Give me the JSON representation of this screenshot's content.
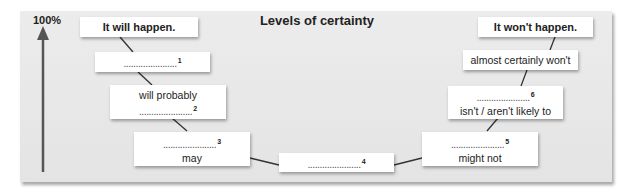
{
  "title": "Levels of certainty",
  "axis": {
    "top_label": "100%"
  },
  "blank": "......................",
  "left_column": [
    {
      "id": "will-happen",
      "lines": [
        "It will happen."
      ],
      "bold": true
    },
    {
      "id": "blank-1",
      "lines": [
        "BLANK"
      ],
      "number": "1"
    },
    {
      "id": "will-probably",
      "lines": [
        "will probably",
        "BLANK"
      ],
      "number": "2"
    },
    {
      "id": "may",
      "lines": [
        "BLANK",
        "may"
      ],
      "number": "3"
    }
  ],
  "center": {
    "id": "blank-4",
    "number": "4"
  },
  "right_column": [
    {
      "id": "might-not",
      "lines": [
        "BLANK",
        "might not"
      ],
      "number": "5"
    },
    {
      "id": "not-likely",
      "lines": [
        "BLANK",
        "isn't / aren't likely to"
      ],
      "number": "6"
    },
    {
      "id": "almost-certainly-wont",
      "lines": [
        "almost certainly won't"
      ]
    },
    {
      "id": "wont-happen",
      "lines": [
        "It won't happen."
      ],
      "bold": true
    }
  ],
  "labels": {
    "will_happen": "It will happen.",
    "will_probably": "will probably",
    "may": "may",
    "might_not": "might not",
    "not_likely": "isn't / aren't likely to",
    "almost_certainly_wont": "almost certainly won't",
    "wont_happen": "It won't happen.",
    "n1": "1",
    "n2": "2",
    "n3": "3",
    "n4": "4",
    "n5": "5",
    "n6": "6"
  }
}
